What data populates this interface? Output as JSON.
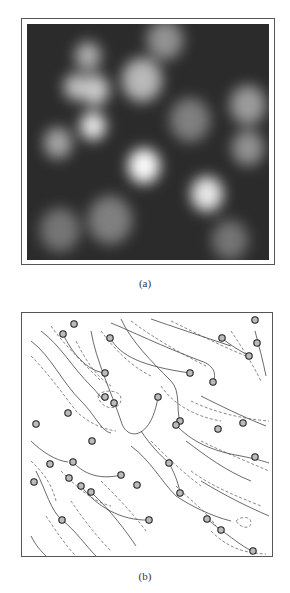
{
  "figure": {
    "panels": [
      {
        "id": "a",
        "caption": "(a)",
        "kind": "grayscale-intensity-map",
        "blobs": [
          {
            "x": 95,
            "y": 90,
            "r": 14,
            "v": 0.75
          },
          {
            "x": 88,
            "y": 56,
            "r": 13,
            "v": 0.6
          },
          {
            "x": 76,
            "y": 87,
            "r": 12,
            "v": 0.7
          },
          {
            "x": 142,
            "y": 80,
            "r": 20,
            "v": 0.65
          },
          {
            "x": 93,
            "y": 126,
            "r": 13,
            "v": 0.9
          },
          {
            "x": 58,
            "y": 143,
            "r": 14,
            "v": 0.55
          },
          {
            "x": 144,
            "y": 166,
            "r": 16,
            "v": 1.0
          },
          {
            "x": 207,
            "y": 194,
            "r": 16,
            "v": 0.9
          },
          {
            "x": 248,
            "y": 105,
            "r": 18,
            "v": 0.5
          },
          {
            "x": 248,
            "y": 148,
            "r": 16,
            "v": 0.45
          },
          {
            "x": 165,
            "y": 40,
            "r": 18,
            "v": 0.45
          },
          {
            "x": 190,
            "y": 120,
            "r": 20,
            "v": 0.35
          },
          {
            "x": 110,
            "y": 220,
            "r": 22,
            "v": 0.35
          },
          {
            "x": 60,
            "y": 230,
            "r": 20,
            "v": 0.3
          },
          {
            "x": 230,
            "y": 240,
            "r": 18,
            "v": 0.3
          }
        ]
      },
      {
        "id": "b",
        "caption": "(b)",
        "kind": "contour-map-with-markers",
        "markers": [
          [
            73,
            323
          ],
          [
            62,
            333
          ],
          [
            109,
            337
          ],
          [
            104,
            372
          ],
          [
            104,
            396
          ],
          [
            113,
            402
          ],
          [
            67,
            412
          ],
          [
            35,
            423
          ],
          [
            189,
            372
          ],
          [
            212,
            381
          ],
          [
            254,
            319
          ],
          [
            221,
            337
          ],
          [
            256,
            342
          ],
          [
            248,
            355
          ],
          [
            157,
            396
          ],
          [
            179,
            420
          ],
          [
            175,
            424
          ],
          [
            242,
            422
          ],
          [
            217,
            428
          ],
          [
            91,
            440
          ],
          [
            72,
            461
          ],
          [
            49,
            463
          ],
          [
            33,
            481
          ],
          [
            68,
            477
          ],
          [
            80,
            485
          ],
          [
            90,
            491
          ],
          [
            120,
            474
          ],
          [
            136,
            484
          ],
          [
            61,
            519
          ],
          [
            148,
            519
          ],
          [
            254,
            456
          ],
          [
            168,
            462
          ],
          [
            179,
            492
          ],
          [
            206,
            518
          ],
          [
            220,
            529
          ],
          [
            252,
            550
          ]
        ]
      }
    ]
  }
}
